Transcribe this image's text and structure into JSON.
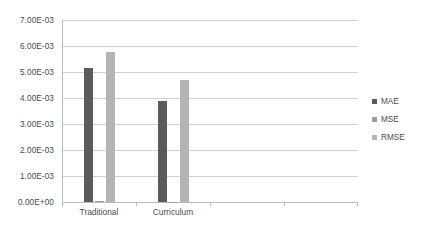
{
  "chart_data": {
    "type": "bar",
    "title": "",
    "subtitle": "",
    "xlabel": "",
    "ylabel": "",
    "categories": [
      "Traditional",
      "Curriculum"
    ],
    "series": [
      {
        "name": "MAE",
        "color": "#5b5b5b",
        "values": [
          0.00515,
          0.0039
        ]
      },
      {
        "name": "MSE",
        "color": "#9c9c9c",
        "values": [
          2.7e-05,
          1.55e-05
        ]
      },
      {
        "name": "RMSE",
        "color": "#b4b4b4",
        "values": [
          0.00577,
          0.0047
        ]
      }
    ],
    "ylim": [
      0,
      0.007
    ],
    "y_tick_values": [
      0,
      0.001,
      0.002,
      0.003,
      0.004,
      0.005,
      0.006,
      0.007
    ],
    "y_tick_labels": [
      "0.00E+00",
      "1.00E-03",
      "2.00E-03",
      "3.00E-03",
      "4.00E-03",
      "5.00E-03",
      "6.00E-03",
      "7.00E-03"
    ],
    "grid": true,
    "gridline_color": "#d2d2d2",
    "axis_color": "#b9b9b9",
    "background": "#ffffff",
    "legend_position": "right",
    "legend_entries": [
      "MAE",
      "MSE",
      "RMSE"
    ]
  }
}
